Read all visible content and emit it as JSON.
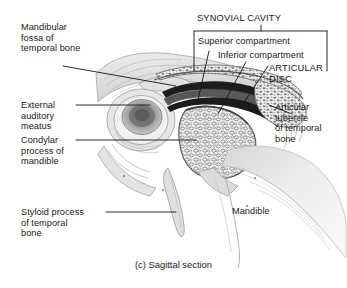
{
  "figure": {
    "caption": "(c) Sagittal section",
    "title_group": "SYNOVIAL CAVITY"
  },
  "labels": {
    "mandibular_fossa": "Mandibular\nfossa of\ntemporal bone",
    "external_auditory_meatus": "External\nauditory\nmeatus",
    "condylar_process": "Condylar\nprocess of\nmandible",
    "styloid_process": "Styloid process\nof temporal\nbone",
    "synovial_cavity": "SYNOVIAL CAVITY",
    "superior_compartment": "Superior compartment",
    "inferior_compartment": "Inferior compartment",
    "articular_disc": "ARTICULAR\nDISC",
    "articular_tubercle": "Articular\ntubercle\nof temporal\nbone",
    "mandible": "Mandible"
  },
  "colors": {
    "ink": "#1a1a1a",
    "leader": "#141414",
    "bone_light": "#e9e9e9",
    "bone_mid": "#bdbdbd",
    "bone_dark": "#8f8f8f",
    "cavity_dark": "#1c1c1c",
    "disc": "#4a4a4a",
    "background": "#ffffff"
  }
}
